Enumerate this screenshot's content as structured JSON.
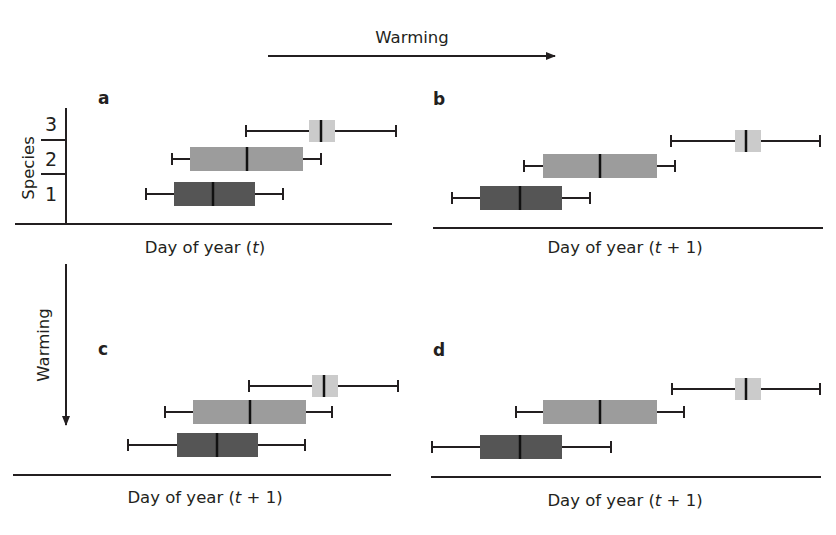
{
  "figure": {
    "top_arrow_label": "Warming",
    "left_arrow_label": "Warming",
    "y_axis_label": "Species",
    "species_ticks": [
      "1",
      "2",
      "3"
    ],
    "colors": {
      "species1": "#555555",
      "species2": "#9c9c9c",
      "species3": "#cbcbcb",
      "line": "#231f20"
    }
  },
  "chart_data": [
    {
      "type": "boxplot",
      "panel": "a",
      "title": "a",
      "xlabel_parts": [
        "Day of year (",
        "t",
        ")"
      ],
      "xlabel": "Day of year (t)",
      "ylabel": "Species",
      "categories": [
        "1",
        "2",
        "3"
      ],
      "series": [
        {
          "name": "Species 1",
          "whisker_low": 146,
          "q1": 174,
          "median": 213,
          "q3": 255,
          "whisker_high": 283
        },
        {
          "name": "Species 2",
          "whisker_low": 172,
          "q1": 190,
          "median": 247,
          "q3": 303,
          "whisker_high": 321
        },
        {
          "name": "Species 3",
          "whisker_low": 246,
          "q1": 309,
          "median": 321,
          "q3": 335,
          "whisker_high": 396
        }
      ],
      "note": "values are relative horizontal positions (pixel units), no numeric axis shown"
    },
    {
      "type": "boxplot",
      "panel": "b",
      "title": "b",
      "xlabel_parts": [
        "Day of year (",
        "t",
        " + 1)"
      ],
      "xlabel": "Day of year (t + 1)",
      "categories": [
        "1",
        "2",
        "3"
      ],
      "series": [
        {
          "name": "Species 1",
          "whisker_low": 452,
          "q1": 480,
          "median": 520,
          "q3": 562,
          "whisker_high": 590
        },
        {
          "name": "Species 2",
          "whisker_low": 524,
          "q1": 543,
          "median": 600,
          "q3": 657,
          "whisker_high": 675
        },
        {
          "name": "Species 3",
          "whisker_low": 671,
          "q1": 735,
          "median": 746,
          "q3": 761,
          "whisker_high": 820
        }
      ]
    },
    {
      "type": "boxplot",
      "panel": "c",
      "title": "c",
      "xlabel_parts": [
        "Day of year (",
        "t",
        " + 1)"
      ],
      "xlabel": "Day of year (t + 1)",
      "categories": [
        "1",
        "2",
        "3"
      ],
      "series": [
        {
          "name": "Species 1",
          "whisker_low": 128,
          "q1": 177,
          "median": 217,
          "q3": 258,
          "whisker_high": 305
        },
        {
          "name": "Species 2",
          "whisker_low": 165,
          "q1": 193,
          "median": 250,
          "q3": 306,
          "whisker_high": 332
        },
        {
          "name": "Species 3",
          "whisker_low": 249,
          "q1": 312,
          "median": 324,
          "q3": 338,
          "whisker_high": 398
        }
      ]
    },
    {
      "type": "boxplot",
      "panel": "d",
      "title": "d",
      "xlabel_parts": [
        "Day of year (",
        "t",
        " + 1)"
      ],
      "xlabel": "Day of year (t + 1)",
      "categories": [
        "1",
        "2",
        "3"
      ],
      "series": [
        {
          "name": "Species 1",
          "whisker_low": 432,
          "q1": 480,
          "median": 520,
          "q3": 562,
          "whisker_high": 611
        },
        {
          "name": "Species 2",
          "whisker_low": 516,
          "q1": 543,
          "median": 600,
          "q3": 657,
          "whisker_high": 684
        },
        {
          "name": "Species 3",
          "whisker_low": 672,
          "q1": 735,
          "median": 746,
          "q3": 761,
          "whisker_high": 820
        }
      ]
    }
  ]
}
